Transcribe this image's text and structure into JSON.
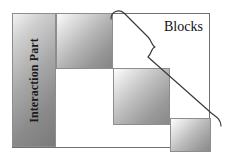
{
  "diagram": {
    "labels": {
      "interaction_part": "Interaction Part",
      "blocks": "Blocks"
    },
    "frame": {
      "stroke_color": "#6f6f6f"
    },
    "blocks": [
      {
        "name": "interaction-part-block",
        "label": "Interaction Part",
        "orientation": "vertical",
        "fill": "gradient-gray"
      },
      {
        "name": "block-two",
        "label": "",
        "orientation": "horizontal",
        "fill": "gradient-gray"
      },
      {
        "name": "block-three",
        "label": "",
        "orientation": "horizontal",
        "fill": "gradient-gray"
      },
      {
        "name": "block-four",
        "label": "",
        "orientation": "horizontal",
        "fill": "gradient-gray"
      }
    ],
    "brace": {
      "name": "diagonal-curly-brace",
      "stroke_color": "#3a3a3a",
      "points_to": "Blocks"
    },
    "colors": {
      "border": "#6f6f6f",
      "block_border": "#8d8d8d",
      "text": "#111111",
      "brace": "#3a3a3a",
      "background": "#ffffff"
    }
  }
}
